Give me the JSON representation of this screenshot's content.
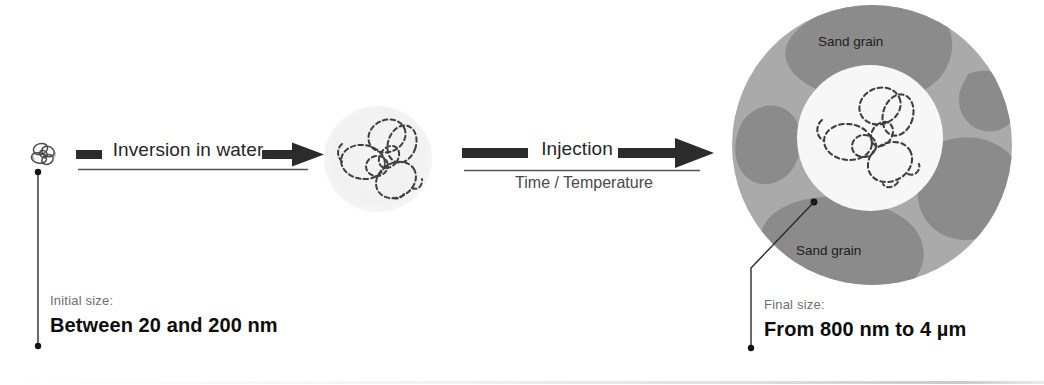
{
  "figure": {
    "type": "process-diagram",
    "background_color": "#ffffff",
    "stages": [
      {
        "id": "initial",
        "name": "initial-nanoparticle"
      },
      {
        "id": "swollen",
        "name": "swollen-polymer-coil"
      },
      {
        "id": "final",
        "name": "polymer-particle-in-sand-pore"
      }
    ]
  },
  "arrows": [
    {
      "id": "inversion",
      "label": "Inversion in water",
      "sublabel": ""
    },
    {
      "id": "injection",
      "label": "Injection",
      "sublabel": "Time / Temperature"
    }
  ],
  "captions": {
    "initial": {
      "title": "Initial size:",
      "value": "Between 20 and 200 nm"
    },
    "final": {
      "title": "Final size:",
      "value": "From 800 nm to 4 µm"
    }
  },
  "final_particle": {
    "grain_label_top": "Sand grain",
    "grain_label_bottom": "Sand grain"
  },
  "colors": {
    "pore_fluid": "#a9a9a9",
    "sand_grain": "#8a8a8a",
    "particle_core": "#f6f6f6",
    "coil_stroke": "#3a3a3a",
    "arrow_fill": "#2b2b2b",
    "caption_title": "#6f6f6f",
    "caption_value": "#0d0d0d",
    "leader_line": "#222222"
  }
}
